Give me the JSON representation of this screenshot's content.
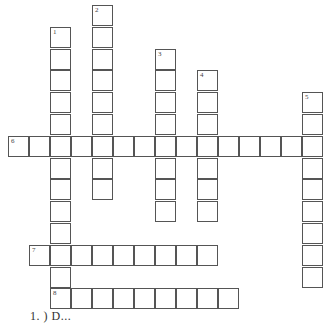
{
  "puzzle": {
    "cell_size": 21,
    "origin_x": 8,
    "origin_y": 5,
    "row_pitch": 21.8,
    "border_color": "#555555",
    "entries": [
      {
        "number": "1",
        "direction": "down",
        "row": 1,
        "col": 2,
        "length": 13
      },
      {
        "number": "2",
        "direction": "down",
        "row": 0,
        "col": 4,
        "length": 9
      },
      {
        "number": "3",
        "direction": "down",
        "row": 2,
        "col": 7,
        "length": 8
      },
      {
        "number": "4",
        "direction": "down",
        "row": 3,
        "col": 9,
        "length": 7
      },
      {
        "number": "5",
        "direction": "down",
        "row": 4,
        "col": 14,
        "length": 9
      },
      {
        "number": "6",
        "direction": "across",
        "row": 6,
        "col": 0,
        "length": 15
      },
      {
        "number": "7",
        "direction": "across",
        "row": 11,
        "col": 1,
        "length": 9
      },
      {
        "number": "8",
        "direction": "across",
        "row": 13,
        "col": 2,
        "length": 9
      }
    ]
  },
  "clues": {
    "partial_line": "1. ) D..."
  }
}
